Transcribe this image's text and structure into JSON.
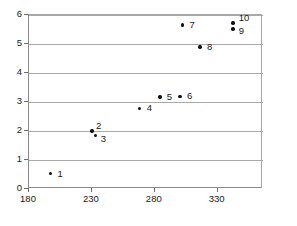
{
  "chart_data": {
    "type": "scatter",
    "title": "",
    "xlabel": "",
    "ylabel": "",
    "xlim": [
      180,
      366
    ],
    "ylim": [
      0,
      6
    ],
    "xticks": [
      180,
      230,
      280,
      330
    ],
    "yticks": [
      0,
      1,
      2,
      3,
      4,
      5,
      6
    ],
    "xtick_labels": [
      "180",
      "230",
      "280",
      "330"
    ],
    "ytick_labels": [
      "0",
      "1",
      "2",
      "3",
      "4",
      "5",
      "6"
    ],
    "grid": "horizontal",
    "legend": "none",
    "marker": "filled-circle",
    "marker_color": "#111111",
    "gridline_color": "#a9a9a9",
    "axis_color": "#8a8a8a",
    "points": [
      {
        "label": "1",
        "x": 197,
        "y": 0.53,
        "label_dx": 7,
        "label_dy": -5
      },
      {
        "label": "2",
        "x": 230,
        "y": 2.0,
        "label_dx": 4,
        "label_dy": -10
      },
      {
        "label": "3",
        "x": 233,
        "y": 1.84,
        "label_dx": 5,
        "label_dy": -2
      },
      {
        "label": "4",
        "x": 268,
        "y": 2.78,
        "label_dx": 7,
        "label_dy": -5
      },
      {
        "label": "5",
        "x": 284,
        "y": 3.17,
        "label_dx": 7,
        "label_dy": -5
      },
      {
        "label": "6",
        "x": 300,
        "y": 3.2,
        "label_dx": 7,
        "label_dy": -5
      },
      {
        "label": "7",
        "x": 302,
        "y": 5.66,
        "label_dx": 7,
        "label_dy": -5
      },
      {
        "label": "8",
        "x": 316,
        "y": 4.9,
        "label_dx": 7,
        "label_dy": -5
      },
      {
        "label": "9",
        "x": 342,
        "y": 5.52,
        "label_dx": 6,
        "label_dy": -3
      },
      {
        "label": "10",
        "x": 342,
        "y": 5.72,
        "label_dx": 6,
        "label_dy": -10
      }
    ]
  }
}
